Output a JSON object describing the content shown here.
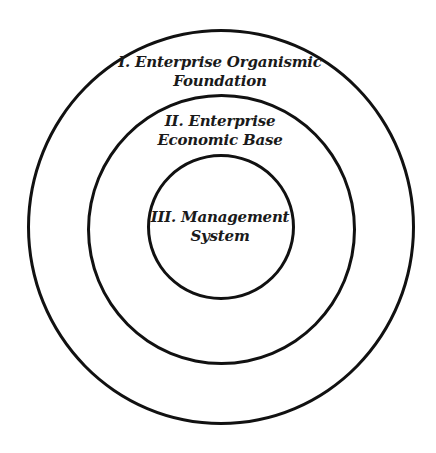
{
  "diagram": {
    "type": "concentric-circles",
    "colors": {
      "background": "#ffffff",
      "stroke": "#111111",
      "text": "#1a1a1a"
    },
    "rings": [
      {
        "level": "outer",
        "lines": [
          "I. Enterprise Organismic",
          "Foundation"
        ]
      },
      {
        "level": "middle",
        "lines": [
          "II. Enterprise",
          "Economic Base"
        ]
      },
      {
        "level": "inner",
        "lines": [
          "III. Management",
          "System"
        ]
      }
    ]
  }
}
